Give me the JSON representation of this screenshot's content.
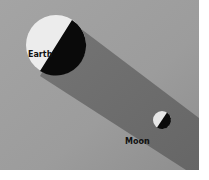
{
  "diagram": {
    "labels": {
      "earth": "Earth",
      "moon": "Moon"
    },
    "colors": {
      "background_light": "#a8a8a8",
      "background_dark": "#8a8a8a",
      "shadow": "#6e6e6e",
      "lit_side": "#ececec",
      "dark_side": "#0a0a0a",
      "label": "#111111"
    }
  }
}
